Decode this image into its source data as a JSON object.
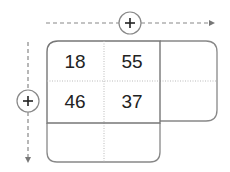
{
  "grid": {
    "cells": [
      [
        "18",
        "55"
      ],
      [
        "46",
        "37"
      ]
    ],
    "rows": 2,
    "cols": 2
  },
  "controls": {
    "add_column_icon": "plus-circle-icon",
    "add_row_icon": "plus-circle-icon",
    "add_column_symbol": "+",
    "add_row_symbol": "+"
  },
  "colors": {
    "border": "#777777",
    "dashed": "#888888",
    "text": "#222222"
  }
}
